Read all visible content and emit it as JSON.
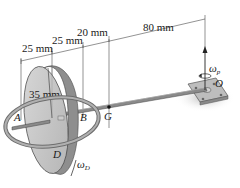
{
  "diagram": {
    "type": "engineering-mechanics-figure",
    "dimensions": {
      "d1": "25 mm",
      "d2": "25 mm",
      "d3": "20 mm",
      "d4": "80 mm",
      "radius": "35 mm"
    },
    "points": {
      "A": "A",
      "B": "B",
      "G": "G",
      "O": "O",
      "D": "D"
    },
    "angular_velocities": {
      "precession": {
        "symbol": "ω",
        "subscript": "p"
      },
      "spin": {
        "symbol": "ω",
        "subscript": "D"
      }
    },
    "colors": {
      "disk_face": "#c8c8c8",
      "disk_rim": "#8e8e8e",
      "ring": "#9a9a9a",
      "rod": "#7d7d7d",
      "plate": "#b8b8b8",
      "line": "#3a3a3a",
      "background": "#ffffff"
    }
  }
}
